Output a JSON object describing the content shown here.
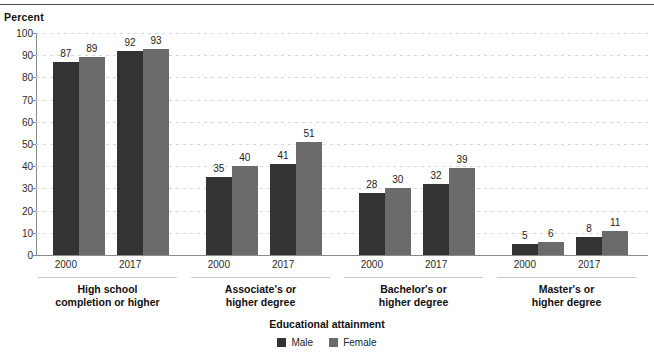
{
  "figure": {
    "percent_axis_label": "Percent",
    "x_axis_title": "Educational attainment"
  },
  "legend": {
    "items": [
      {
        "label": "Male",
        "color": "#333333"
      },
      {
        "label": "Female",
        "color": "#6b6b6b"
      }
    ]
  },
  "chart_data": {
    "type": "bar",
    "title": "",
    "xlabel": "Educational attainment",
    "ylabel": "Percent",
    "ylim": [
      0,
      100
    ],
    "yticks": [
      0,
      10,
      20,
      30,
      40,
      50,
      60,
      70,
      80,
      90,
      100
    ],
    "grid": true,
    "legend_position": "bottom",
    "group_labels": [
      "High school\ncompletion or higher",
      "Associate's or\nhigher degree",
      "Bachelor's or\nhigher degree",
      "Master's or\nhigher degree"
    ],
    "categories": [
      "2000",
      "2017"
    ],
    "series": [
      {
        "name": "Male",
        "color": "#333333"
      },
      {
        "name": "Female",
        "color": "#6b6b6b"
      }
    ],
    "groups": [
      {
        "label": "High school\ncompletion or higher",
        "years": [
          {
            "year": "2000",
            "Male": 87,
            "Female": 89
          },
          {
            "year": "2017",
            "Male": 92,
            "Female": 93
          }
        ]
      },
      {
        "label": "Associate's or\nhigher degree",
        "years": [
          {
            "year": "2000",
            "Male": 35,
            "Female": 40
          },
          {
            "year": "2017",
            "Male": 41,
            "Female": 51
          }
        ]
      },
      {
        "label": "Bachelor's or\nhigher degree",
        "years": [
          {
            "year": "2000",
            "Male": 28,
            "Female": 30
          },
          {
            "year": "2017",
            "Male": 32,
            "Female": 39
          }
        ]
      },
      {
        "label": "Master's or\nhigher degree",
        "years": [
          {
            "year": "2000",
            "Male": 5,
            "Female": 6
          },
          {
            "year": "2017",
            "Male": 8,
            "Female": 11
          }
        ]
      }
    ]
  }
}
